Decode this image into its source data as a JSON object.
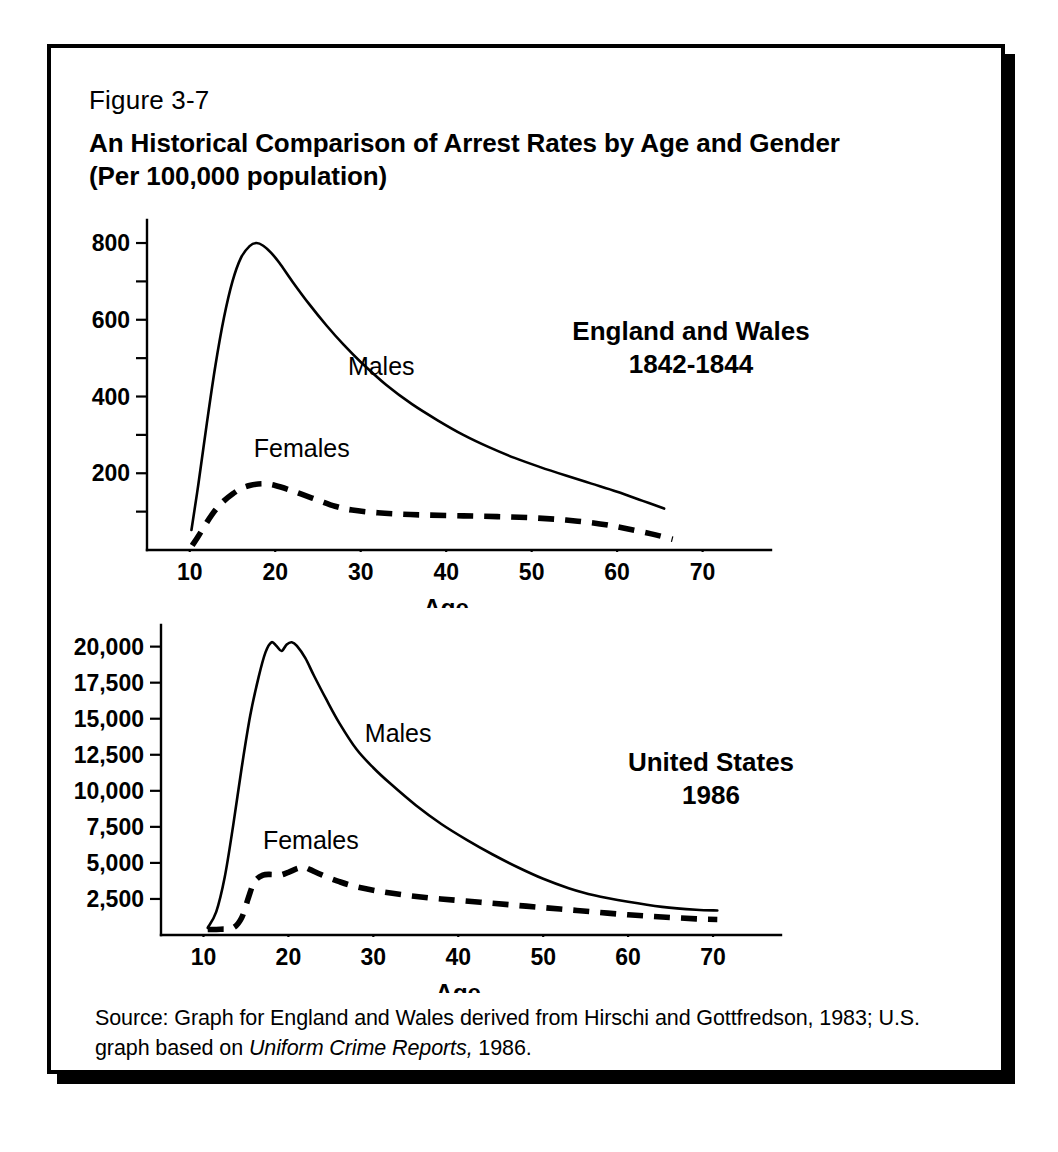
{
  "figure": {
    "number": "Figure 3-7",
    "title_line1": "An Historical Comparison of Arrest Rates by Age and Gender",
    "title_line2": "(Per 100,000 population)",
    "source_prefix": "Source: Graph for England and Wales derived from Hirschi and Gottfredson, 1983; U.S. graph based on ",
    "source_italic": "Uniform Crime Reports,",
    "source_suffix": " 1986."
  },
  "chart_data": [
    {
      "id": "england-wales",
      "type": "line",
      "title": "England and Wales",
      "subtitle": "1842-1844",
      "xlabel": "Age",
      "ylabel": "",
      "xlim": [
        5,
        78
      ],
      "ylim": [
        0,
        860
      ],
      "xticks": [
        10,
        20,
        30,
        40,
        50,
        60,
        70
      ],
      "xtick_labels": [
        "10",
        "20",
        "30",
        "40",
        "50",
        "60",
        "70"
      ],
      "yticks": [
        200,
        400,
        600,
        800
      ],
      "ytick_labels": [
        "200",
        "400",
        "600",
        "800"
      ],
      "yticks_minor": [
        100,
        300,
        500,
        700
      ],
      "grid": false,
      "legend": "inline-annotations",
      "series": [
        {
          "name": "Males",
          "style": "solid",
          "label_x": 28.5,
          "label_y": 455,
          "x": [
            10.2,
            11,
            12,
            13,
            14,
            15,
            16,
            17,
            17.8,
            18.6,
            19.5,
            20.5,
            22,
            24,
            26,
            28,
            30,
            33,
            36,
            39,
            42,
            45,
            48,
            51,
            54,
            57,
            60,
            63,
            65.5
          ],
          "y": [
            52,
            170,
            330,
            480,
            605,
            700,
            762,
            792,
            800,
            793,
            775,
            748,
            700,
            640,
            585,
            535,
            490,
            430,
            380,
            338,
            300,
            268,
            240,
            216,
            194,
            173,
            152,
            128,
            108
          ]
        },
        {
          "name": "Females",
          "style": "dashed",
          "label_x": 17.5,
          "label_y": 243,
          "x": [
            10.3,
            11,
            12,
            13,
            14,
            15,
            16,
            17,
            18,
            19,
            20,
            21.5,
            23,
            25,
            27,
            29,
            32,
            35,
            38,
            42,
            46,
            50,
            54,
            58,
            61,
            64,
            66.5
          ],
          "y": [
            12,
            36,
            72,
            104,
            128,
            146,
            160,
            168,
            172,
            172,
            168,
            158,
            146,
            130,
            114,
            104,
            97,
            93,
            91,
            89,
            87,
            84,
            78,
            68,
            56,
            42,
            28
          ]
        }
      ]
    },
    {
      "id": "united-states",
      "type": "line",
      "title": "United States",
      "subtitle": "1986",
      "xlabel": "Age",
      "ylabel": "",
      "xlim": [
        5,
        78
      ],
      "ylim": [
        0,
        21500
      ],
      "xticks": [
        10,
        20,
        30,
        40,
        50,
        60,
        70
      ],
      "xtick_labels": [
        "10",
        "20",
        "30",
        "40",
        "50",
        "60",
        "70"
      ],
      "yticks": [
        2500,
        5000,
        7500,
        10000,
        12500,
        15000,
        17500,
        20000
      ],
      "ytick_labels": [
        "2,500",
        "5,000",
        "7,500",
        "10,000",
        "12,500",
        "15,000",
        "17,500",
        "20,000"
      ],
      "yticks_minor": [],
      "grid": false,
      "legend": "inline-annotations",
      "series": [
        {
          "name": "Males",
          "style": "solid",
          "label_x": 29,
          "label_y": 13400,
          "x": [
            10.5,
            11.5,
            12.5,
            13.5,
            14.5,
            15.5,
            16.5,
            17.3,
            18,
            18.6,
            19.2,
            19.8,
            20.4,
            21,
            22,
            23,
            24.5,
            26,
            28,
            30,
            32,
            35,
            38,
            41,
            44,
            47,
            50,
            53,
            56,
            60,
            64,
            68,
            70.5
          ],
          "y": [
            500,
            1600,
            4000,
            7600,
            11600,
            15200,
            17900,
            19600,
            20300,
            20050,
            19700,
            20150,
            20300,
            20050,
            19200,
            18000,
            16300,
            14700,
            12900,
            11600,
            10500,
            9000,
            7700,
            6600,
            5600,
            4700,
            3900,
            3250,
            2750,
            2300,
            1950,
            1750,
            1700
          ]
        },
        {
          "name": "Females",
          "style": "dashed",
          "label_x": 17,
          "label_y": 5950,
          "x": [
            10.5,
            12,
            13.5,
            14.5,
            15.3,
            16,
            17,
            18,
            19,
            20,
            21,
            21.8,
            22.5,
            24,
            26,
            28,
            31,
            34,
            37,
            40,
            44,
            48,
            52,
            56,
            60,
            64,
            68,
            70.5
          ],
          "y": [
            380,
            400,
            500,
            1200,
            2600,
            3700,
            4150,
            4200,
            4150,
            4350,
            4600,
            4700,
            4550,
            4150,
            3700,
            3350,
            3000,
            2750,
            2550,
            2400,
            2200,
            2000,
            1800,
            1600,
            1400,
            1250,
            1120,
            1080
          ]
        }
      ]
    }
  ]
}
